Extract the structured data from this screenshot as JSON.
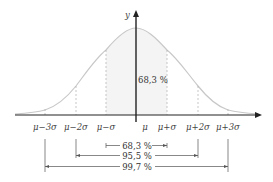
{
  "diagram": {
    "y_axis_label": "y",
    "center_label": "68,3 %",
    "x_ticks": [
      "μ−3σ",
      "μ−2σ",
      "μ−σ",
      "μ",
      "μ+σ",
      "μ+2σ",
      "μ+3σ"
    ],
    "intervals": [
      {
        "label": "68,3 %",
        "from": "μ−σ",
        "to": "μ+σ"
      },
      {
        "label": "95,5 %",
        "from": "μ−2σ",
        "to": "μ+2σ"
      },
      {
        "label": "99,7 %",
        "from": "μ−3σ",
        "to": "μ+3σ"
      }
    ],
    "colors": {
      "curve": "#c8c8c8",
      "axis": "#222222",
      "shade": "#f3f3f3",
      "dashed": "#b0b0b0",
      "text": "#444444"
    }
  }
}
